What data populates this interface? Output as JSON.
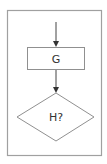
{
  "diagram": {
    "type": "flowchart",
    "nodes": [
      {
        "id": "G",
        "shape": "process",
        "label": "G"
      },
      {
        "id": "H",
        "shape": "decision",
        "label": "H?"
      }
    ],
    "edges": [
      {
        "from": "entry",
        "to": "G"
      },
      {
        "from": "G",
        "to": "H"
      }
    ],
    "colors": {
      "stroke": "#888888",
      "arrow": "#444444",
      "text": "#333333",
      "frame": "#999999"
    }
  }
}
